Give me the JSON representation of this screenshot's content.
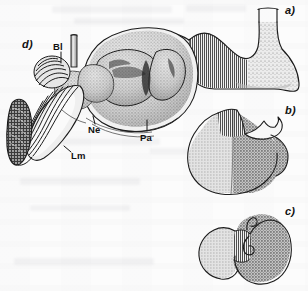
{
  "figure": {
    "kind": "scanned-anatomical-plate",
    "background_color": "#fcfcfc",
    "ink_color": "#1a1a1a",
    "width": 308,
    "height": 291,
    "panels": [
      {
        "id": "a",
        "label": "a)",
        "label_x": 284,
        "label_y": 8,
        "description": "Simple stomach, vertical-hatched left region and stippled right region, with esophagus at top and duodenum at left",
        "regions": [
          {
            "name": "hatched-region",
            "fill": "vertical-hatch",
            "color": "#d9d9d9"
          },
          {
            "name": "stippled-region",
            "fill": "fine-stipple",
            "color": "#dcdcdc"
          }
        ]
      },
      {
        "id": "b",
        "label": "b)",
        "label_x": 284,
        "label_y": 106,
        "description": "Rounded stomach, light grey left half, darker grey right half, vertical hatch band at top, pale caecum-like appendage",
        "regions": [
          {
            "name": "light-grey-region",
            "fill": "halftone",
            "color": "#d2d2d2"
          },
          {
            "name": "dark-grey-region",
            "fill": "halftone",
            "color": "#a8a8a8"
          },
          {
            "name": "hatched-band",
            "fill": "vertical-hatch",
            "color": "#cfcfcf"
          },
          {
            "name": "pale-appendage",
            "fill": "solid",
            "color": "#f6f6f6"
          }
        ]
      },
      {
        "id": "c",
        "label": "c)",
        "label_x": 284,
        "label_y": 208,
        "description": "Bean/kidney shaped stomach, light grey left lobe, dark grey right lobe, narrow vertical hatched isthmus between",
        "regions": [
          {
            "name": "light-grey-lobe",
            "fill": "halftone",
            "color": "#cfcfcf"
          },
          {
            "name": "dark-grey-lobe",
            "fill": "halftone",
            "color": "#a5a5a5"
          },
          {
            "name": "hatched-isthmus",
            "fill": "vertical-hatch",
            "color": "#c8c8c8"
          }
        ]
      },
      {
        "id": "d",
        "label": "d)",
        "label_x": 22,
        "label_y": 44,
        "description": "Detailed stippled pen-and-ink drawing of a complex multi-chambered stomach with labelled parts"
      }
    ],
    "part_labels": [
      {
        "key": "Bl",
        "text": "Bl",
        "x": 53,
        "y": 50,
        "leader": {
          "x": 60,
          "y": 60,
          "len": 9,
          "dir": "down"
        }
      },
      {
        "key": "Ne",
        "text": "Ne",
        "x": 90,
        "y": 130,
        "leader": {
          "x": 95,
          "y": 124,
          "len": 7,
          "dir": "up"
        }
      },
      {
        "key": "Pa",
        "text": "Pa",
        "x": 141,
        "y": 144,
        "leader": {
          "x": 147,
          "y": 131,
          "len": 12,
          "dir": "up"
        }
      },
      {
        "key": "Lm",
        "text": "Lm",
        "x": 72,
        "y": 157,
        "leader": {
          "x": 70,
          "y": 155,
          "len": 8,
          "dir": "upleft"
        }
      }
    ]
  }
}
